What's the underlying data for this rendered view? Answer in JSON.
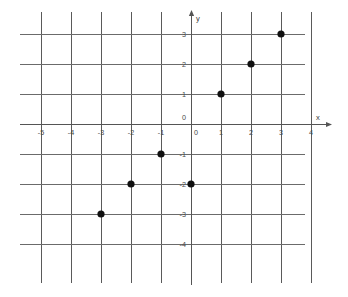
{
  "chart_data": {
    "type": "scatter",
    "title": "",
    "subtitle": "",
    "xlabel": "x",
    "ylabel": "y",
    "xlim": [
      -5,
      4
    ],
    "ylim": [
      -4,
      3
    ],
    "grid": true,
    "legend": false,
    "legend_position": "none",
    "x_ticks": [
      -5,
      -4,
      -3,
      -2,
      -1,
      0,
      1,
      2,
      3,
      4
    ],
    "y_ticks": [
      3,
      2,
      1,
      0,
      -1,
      -2,
      -3,
      -4
    ],
    "x_tick_labels": [
      "-5",
      "-4",
      "-3",
      "-2",
      "-1",
      "0",
      "1",
      "2",
      "3",
      "4"
    ],
    "y_tick_labels": [
      "3",
      "2",
      "1",
      "0",
      "-1",
      "-2",
      "-3",
      "-4"
    ],
    "origin_label": "0",
    "point_color": "#101010",
    "grid_color": "#5a5a5a",
    "axis_color": "#555555",
    "background_color": "#ffffff",
    "points": [
      {
        "x": -3,
        "y": -3,
        "label": "(-3, -3)"
      },
      {
        "x": -2,
        "y": -2,
        "label": "(-2, -2)"
      },
      {
        "x": -1,
        "y": -1,
        "label": "(-1, -1)"
      },
      {
        "x": 0,
        "y": -2,
        "label": "(0, -2)"
      },
      {
        "x": 1,
        "y": 1,
        "label": "(1, 1)"
      },
      {
        "x": 2,
        "y": 2,
        "label": "(2, 2)"
      },
      {
        "x": 3,
        "y": 3,
        "label": "(3, 3)"
      }
    ],
    "x_values": [
      -3,
      -2,
      -1,
      0,
      1,
      2,
      3
    ],
    "y_values": [
      -3,
      -2,
      -1,
      -2,
      1,
      2,
      3
    ]
  },
  "axes": {
    "x_axis_name": "x",
    "y_axis_name": "y"
  }
}
